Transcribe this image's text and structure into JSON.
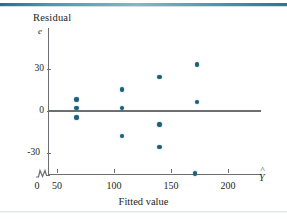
{
  "figure": {
    "y_axis_title": "Residual",
    "y_axis_symbol": "e",
    "x_axis_title": "Fitted value",
    "x_axis_symbol": "Y",
    "x_axis_symbol_hat": "^",
    "axis_break_icon": "axis-break-zigzag",
    "point_color": "#1c6079",
    "axis_color": "#6d6e71",
    "rule_color": "#4f97b4"
  },
  "chart_data": {
    "type": "scatter",
    "title": "",
    "xlabel": "Fitted value",
    "ylabel": "Residual",
    "xlim": [
      0,
      210
    ],
    "ylim": [
      -48,
      40
    ],
    "grid": false,
    "legend": null,
    "xticks": [
      0,
      50,
      100,
      150,
      200
    ],
    "xtick_labels": [
      "0",
      "50",
      "100",
      "150",
      "200"
    ],
    "yticks": [
      -30,
      0,
      30
    ],
    "ytick_labels": [
      "-30",
      "0",
      "30"
    ],
    "annotations": [
      {
        "text": "e",
        "role": "y-axis-variable"
      },
      {
        "text": "Ŷ",
        "role": "x-axis-variable"
      }
    ],
    "reference_line": {
      "y": 0,
      "label": "zero residual line"
    },
    "axis_break": {
      "axis": "x",
      "between": [
        0,
        40
      ]
    },
    "points": [
      {
        "x": 67,
        "y": 8
      },
      {
        "x": 67,
        "y": 2
      },
      {
        "x": 67,
        "y": -5
      },
      {
        "x": 107,
        "y": 15
      },
      {
        "x": 107,
        "y": 2
      },
      {
        "x": 107,
        "y": -18
      },
      {
        "x": 140,
        "y": 24
      },
      {
        "x": 140,
        "y": -10
      },
      {
        "x": 140,
        "y": -26
      },
      {
        "x": 173,
        "y": 33
      },
      {
        "x": 173,
        "y": 6
      },
      {
        "x": 171,
        "y": -45
      }
    ]
  }
}
